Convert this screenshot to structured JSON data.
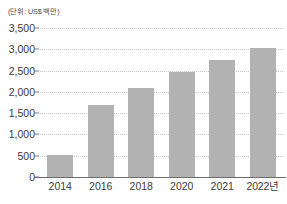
{
  "chart_data": {
    "type": "bar",
    "title": "",
    "subtitle": "",
    "unit_caption": "(단위: US$ 백만)",
    "categories": [
      "2014",
      "2016",
      "2018",
      "2020",
      "2021",
      "2022년"
    ],
    "values": [
      520,
      1700,
      2100,
      2470,
      2750,
      3020
    ],
    "series": [
      {
        "name": "",
        "values": [
          520,
          1700,
          2100,
          2470,
          2750,
          3020
        ]
      }
    ],
    "xlabel": "",
    "ylabel": "",
    "ylim": [
      0,
      3500
    ],
    "ytick_values": [
      0,
      500,
      1000,
      1500,
      2000,
      2500,
      3000,
      3500
    ],
    "ytick_labels": [
      "0",
      "500",
      "1,000",
      "1,500",
      "2,000",
      "2,500",
      "3,000",
      "3,500"
    ],
    "grid": true,
    "grid_style": "dotted-horizontal",
    "legend": false,
    "legend_position": "none",
    "colors": {
      "bar": "#b2b2b2",
      "gridline": "#c9c9c9",
      "axis": "#6d6d6d",
      "text": "#3b3b3b",
      "background": "#ffffff"
    }
  }
}
